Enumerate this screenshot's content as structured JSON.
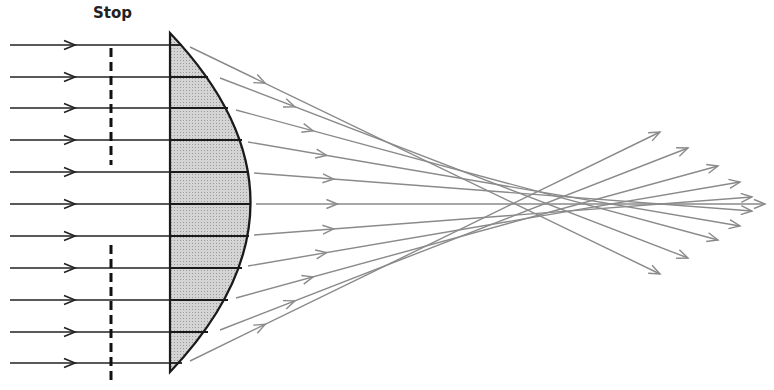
{
  "diagram": {
    "stop_label": "Stop",
    "colors": {
      "incident_ray": "#222222",
      "refracted_ray": "#8a8a8a",
      "lens_fill": "#c9c9c9",
      "lens_outline": "#1a1a1a",
      "stop": "#111111"
    },
    "lens": {
      "flat_x": 170,
      "top_y": 33,
      "bottom_y": 372,
      "apex_x": 251,
      "apex_y": 204
    },
    "stop": {
      "x": 111,
      "upper_segment": [
        48,
        165
      ],
      "lower_segment": [
        245,
        385
      ]
    },
    "incident_rays": [
      {
        "y": 45,
        "curve_x": 182
      },
      {
        "y": 77,
        "curve_x": 208
      },
      {
        "y": 108,
        "curve_x": 228
      },
      {
        "y": 140,
        "curve_x": 242
      },
      {
        "y": 172,
        "curve_x": 249
      },
      {
        "y": 204,
        "curve_x": 251
      },
      {
        "y": 236,
        "curve_x": 249
      },
      {
        "y": 268,
        "curve_x": 242
      },
      {
        "y": 300,
        "curve_x": 228
      },
      {
        "y": 332,
        "curve_x": 208
      },
      {
        "y": 363,
        "curve_x": 182
      }
    ],
    "refracted_rays": [
      {
        "x1": 190,
        "y1": 47,
        "x2": 660,
        "y2": 274
      },
      {
        "x1": 220,
        "y1": 78,
        "x2": 688,
        "y2": 258
      },
      {
        "x1": 236,
        "y1": 110,
        "x2": 718,
        "y2": 240
      },
      {
        "x1": 248,
        "y1": 142,
        "x2": 740,
        "y2": 226
      },
      {
        "x1": 254,
        "y1": 173,
        "x2": 752,
        "y2": 211
      },
      {
        "x1": 256,
        "y1": 204,
        "x2": 765,
        "y2": 204
      },
      {
        "x1": 254,
        "y1": 235,
        "x2": 752,
        "y2": 197
      },
      {
        "x1": 248,
        "y1": 266,
        "x2": 740,
        "y2": 182
      },
      {
        "x1": 236,
        "y1": 298,
        "x2": 718,
        "y2": 166
      },
      {
        "x1": 220,
        "y1": 330,
        "x2": 688,
        "y2": 148
      },
      {
        "x1": 190,
        "y1": 361,
        "x2": 660,
        "y2": 132
      }
    ]
  }
}
